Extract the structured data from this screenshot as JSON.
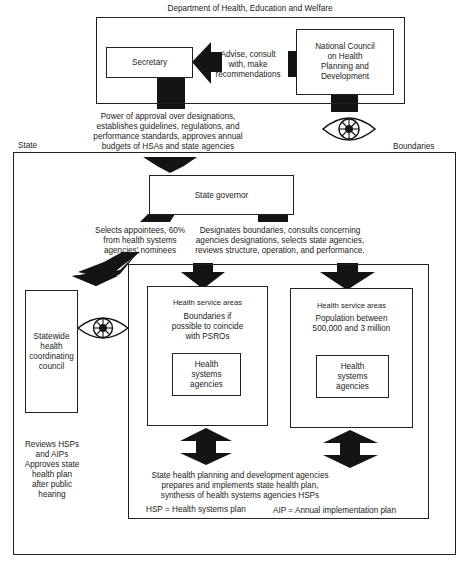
{
  "federal": {
    "title": "Department of Health, Education and Welfare",
    "secretary": "Secretary",
    "advise_lines": [
      "Advise, consult",
      "with, make",
      "recommendations"
    ],
    "national_council_lines": [
      "National Council",
      "on Health",
      "Planning and",
      "Development"
    ],
    "power_lines": [
      "Power of approval over designations,",
      "establishes guidelines, regulations, and",
      "performance standards, approves annual",
      "budgets of HSAs and state agencies"
    ]
  },
  "state": {
    "label": "State",
    "boundaries_label": "Boundaries",
    "governor": "State governor",
    "selects_lines": [
      "Selects appointees, 60%",
      "from health systems",
      "agencies' nominees"
    ],
    "designates_lines": [
      "Designates boundaries, consults concerning",
      "agencies designations, selects state agencies,",
      "reviews structure, operation, and performance."
    ],
    "council_lines": [
      "Statewide",
      "health",
      "coordinating",
      "council"
    ],
    "reviews_lines": [
      "Reviews HSPs",
      "and AIPs",
      "Approves state",
      "health plan",
      "after public",
      "hearing"
    ]
  },
  "areas": [
    {
      "title": "Health service areas",
      "desc_lines": [
        "Boundaries if",
        "possible to coincide",
        "with PSROs"
      ],
      "agency_lines": [
        "Health",
        "systems",
        "agencies"
      ]
    },
    {
      "title": "Health service areas",
      "desc_lines": [
        "Population between",
        "500,000 and 3 million"
      ],
      "agency_lines": [
        "Health",
        "systems",
        "agencies"
      ]
    }
  ],
  "state_agency_lines": [
    "State health planning and development agencies",
    "prepares and implements state health plan,",
    "synthesis of health systems agencies HSPs"
  ],
  "legend": {
    "hsp": "HSP = Health  systems plan",
    "aip": "AIP = Annual implementation plan"
  },
  "icons": {
    "eye": "eye-icon (monitoring/oversight)",
    "arrows": "block-arrow-icons (flow of authority)"
  }
}
